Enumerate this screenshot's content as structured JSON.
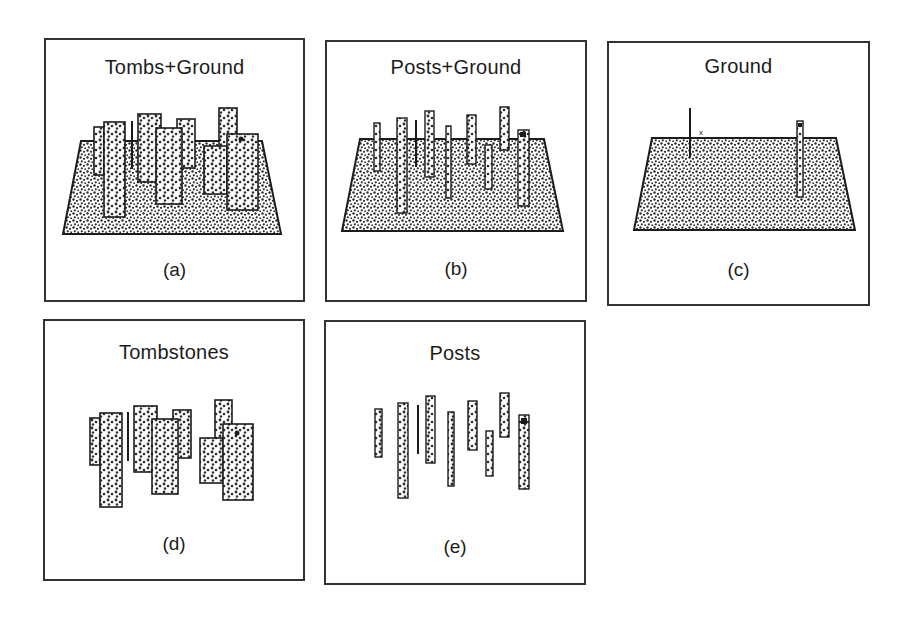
{
  "figure": {
    "panels": [
      {
        "id": "a",
        "title": "Tombs+Ground",
        "label": "(a)",
        "shows_ground": true,
        "objects": "tombstones"
      },
      {
        "id": "b",
        "title": "Posts+Ground",
        "label": "(b)",
        "shows_ground": true,
        "objects": "posts"
      },
      {
        "id": "c",
        "title": "Ground",
        "label": "(c)",
        "shows_ground": true,
        "objects": "ground-remnants"
      },
      {
        "id": "d",
        "title": "Tombstones",
        "label": "(d)",
        "shows_ground": false,
        "objects": "tombstones"
      },
      {
        "id": "e",
        "title": "Posts",
        "label": "(e)",
        "shows_ground": false,
        "objects": "posts"
      }
    ],
    "ground_remnant_marker": "x",
    "colors": {
      "ink": "#1c1c1c",
      "border": "#333333",
      "fill_light": "#ffffff",
      "fill_dot": "#2a2a2a"
    }
  }
}
